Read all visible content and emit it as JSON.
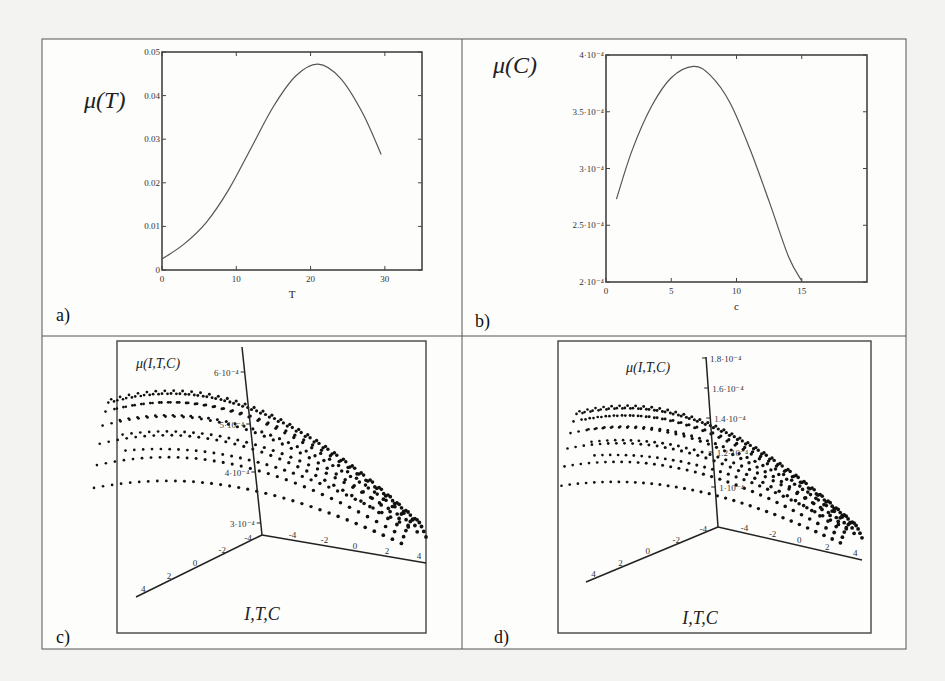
{
  "figure": {
    "panels": [
      {
        "id": "a",
        "label": "a)"
      },
      {
        "id": "b",
        "label": "b)"
      },
      {
        "id": "c",
        "label": "c)"
      },
      {
        "id": "d",
        "label": "d)"
      }
    ]
  },
  "chart_data": [
    {
      "panel": "a",
      "type": "line",
      "title": "μ(T)",
      "xlabel": "T",
      "ylabel": "μ(T)",
      "xlim": [
        0,
        35
      ],
      "ylim": [
        0,
        0.05
      ],
      "xticks": [
        "0",
        "10",
        "20",
        "30"
      ],
      "yticks": [
        "0",
        "0.01",
        "0.02",
        "0.03",
        "0.04",
        "0.05"
      ],
      "grid": false,
      "x": [
        0,
        3,
        6,
        9,
        12,
        15,
        18,
        21,
        24,
        27,
        29.5
      ],
      "y": [
        0.0025,
        0.006,
        0.011,
        0.0185,
        0.028,
        0.0375,
        0.0445,
        0.0472,
        0.044,
        0.036,
        0.0265
      ]
    },
    {
      "panel": "b",
      "type": "line",
      "title": "μ(C)",
      "xlabel": "c",
      "ylabel": "μ(C)",
      "xlim": [
        0,
        20
      ],
      "ylim": [
        0.0002,
        0.0004
      ],
      "xticks": [
        "0",
        "5",
        "10",
        "15"
      ],
      "yticks": [
        "2·10⁻⁴",
        "2.5·10⁻⁴",
        "3·10⁻⁴",
        "3.5·10⁻⁴",
        "4·10⁻⁴"
      ],
      "grid": false,
      "x": [
        0.8,
        2,
        3.5,
        5,
        6.7,
        8,
        9.5,
        11,
        12.5,
        14,
        15
      ],
      "y": [
        0.000273,
        0.000316,
        0.000355,
        0.00038,
        0.00039,
        0.000382,
        0.000358,
        0.000318,
        0.000271,
        0.000222,
        0.000201
      ]
    },
    {
      "panel": "c",
      "type": "scatter",
      "title": "μ(I,T,C)",
      "xlabel": "I,T,C",
      "zlabel": "μ(I,T,C)",
      "zticks": [
        "3·10⁻⁴",
        "4·10⁻⁴",
        "5·10⁻⁴",
        "6·10⁻⁴"
      ],
      "left_axis_ticks": [
        "4",
        "2",
        "0",
        "-2",
        "-4"
      ],
      "right_axis_ticks": [
        "-4",
        "-2",
        "0",
        "2",
        "4"
      ],
      "note": "3D point cloud surface, peak ≈5·10⁻⁴ on left side, descending toward right axis"
    },
    {
      "panel": "d",
      "type": "scatter",
      "title": "μ(I,T,C)",
      "xlabel": "I,T,C",
      "zlabel": "μ(I,T,C)",
      "zticks": [
        "1·10⁻⁴",
        "1.2·10⁻⁴",
        "1.4·10⁻⁴",
        "1.6·10⁻⁴",
        "1.8·10⁻⁴"
      ],
      "left_axis_ticks": [
        "4",
        "2",
        "0",
        "-2",
        "-4"
      ],
      "right_axis_ticks": [
        "-4",
        "-2",
        "0",
        "2",
        "4"
      ],
      "note": "3D point cloud surface, peak ≈1.3·10⁻⁴ on left side, descending toward right axis"
    }
  ]
}
